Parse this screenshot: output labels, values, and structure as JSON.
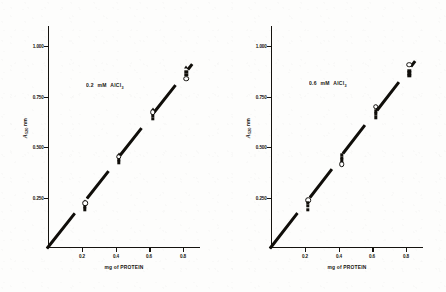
{
  "figure": {
    "panel_count": 2
  },
  "chart_data": [
    {
      "type": "scatter",
      "panel": "left",
      "title": "",
      "annotation": "0.2 mM AlCl3",
      "annotation_parts": {
        "concentration": "0.2",
        "unit": "mM",
        "compound": "AlCl",
        "compound_sub": "3"
      },
      "xlabel": "mg of PROTEIN",
      "ylabel": "A 520 nm",
      "ylabel_parts": {
        "symbol": "A",
        "subscript": "520",
        "unit": "nm"
      },
      "xticks": [
        "0.2",
        "0.4",
        "0.6",
        "0.8"
      ],
      "xtick_values": [
        0.2,
        0.4,
        0.6,
        0.8
      ],
      "yticks": [
        "0.250",
        "0.500",
        "0.750",
        "1.000"
      ],
      "ytick_values": [
        0.25,
        0.5,
        0.75,
        1.0
      ],
      "xlim": [
        0,
        0.9
      ],
      "ylim": [
        0,
        1.1
      ],
      "grid": false,
      "legend": "none",
      "x": [
        0.2,
        0.4,
        0.6,
        0.8
      ],
      "values": [
        0.21,
        0.44,
        0.65,
        0.85
      ],
      "series": [
        {
          "name": "triangle",
          "marker": "filled-triangle",
          "values": [
            0.235,
            0.468,
            0.688,
            0.895
          ]
        },
        {
          "name": "open-circle",
          "marker": "open-circle",
          "values": [
            0.222,
            0.452,
            0.672,
            0.838
          ]
        },
        {
          "name": "square-upper",
          "marker": "filled-square",
          "values": [
            0.205,
            0.438,
            0.655,
            0.872
          ]
        },
        {
          "name": "square-lower",
          "marker": "filled-square",
          "values": [
            0.192,
            0.424,
            0.64,
            0.858
          ]
        }
      ],
      "fit_line": {
        "intercept": 0.0,
        "slope": 1.06,
        "through_origin": true
      }
    },
    {
      "type": "scatter",
      "panel": "right",
      "title": "",
      "annotation": "0.6 mM AlCl3",
      "annotation_parts": {
        "concentration": "0.6",
        "unit": "mM",
        "compound": "AlCl",
        "compound_sub": "3"
      },
      "xlabel": "mg of PROTEIN",
      "ylabel": "A 520 nm",
      "ylabel_parts": {
        "symbol": "A",
        "subscript": "520",
        "unit": "nm"
      },
      "xticks": [
        "0.2",
        "0.4",
        "0.6",
        "0.8"
      ],
      "xtick_values": [
        0.2,
        0.4,
        0.6,
        0.8
      ],
      "yticks": [
        "0.250",
        "0.500",
        "0.750",
        "1.000"
      ],
      "ytick_values": [
        0.25,
        0.5,
        0.75,
        1.0
      ],
      "xlim": [
        0,
        0.9
      ],
      "ylim": [
        0,
        1.1
      ],
      "grid": false,
      "legend": "none",
      "x": [
        0.2,
        0.4,
        0.6,
        0.8
      ],
      "values": [
        0.21,
        0.45,
        0.66,
        0.87
      ],
      "series": [
        {
          "name": "open-circle",
          "marker": "open-circle",
          "values": [
            0.238,
            0.414,
            0.7,
            0.908
          ]
        },
        {
          "name": "square-upper",
          "marker": "filled-square",
          "values": [
            0.225,
            0.462,
            0.678,
            0.878
          ]
        },
        {
          "name": "square-mid",
          "marker": "filled-square",
          "values": [
            0.208,
            0.448,
            0.665,
            0.865
          ]
        },
        {
          "name": "square-lower",
          "marker": "filled-square",
          "values": [
            0.19,
            0.434,
            0.648,
            0.852
          ]
        }
      ],
      "fit_line": {
        "intercept": 0.0,
        "slope": 1.08,
        "through_origin": true
      }
    }
  ]
}
